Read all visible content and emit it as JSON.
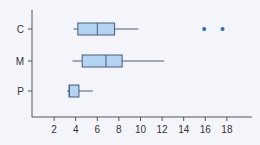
{
  "chart_data": {
    "type": "boxplot",
    "title": "",
    "xlabel": "",
    "ylabel": "",
    "categories": [
      "C",
      "M",
      "P"
    ],
    "x_ticks": [
      2,
      4,
      6,
      8,
      10,
      12,
      14,
      16,
      18
    ],
    "xlim": [
      0,
      20
    ],
    "grid": false,
    "series": [
      {
        "name": "C",
        "whisker_low": 3.8,
        "q1": 4.2,
        "median": 6.0,
        "q3": 7.6,
        "whisker_high": 9.8,
        "outliers": [
          15.9,
          17.6
        ]
      },
      {
        "name": "M",
        "whisker_low": 3.7,
        "q1": 4.6,
        "median": 6.8,
        "q3": 8.3,
        "whisker_high": 12.2,
        "outliers": []
      },
      {
        "name": "P",
        "whisker_low": 3.2,
        "q1": 3.4,
        "median": 3.4,
        "q3": 4.3,
        "whisker_high": 5.6,
        "outliers": []
      }
    ],
    "colors": {
      "box_fill": "#b3d4f5",
      "box_stroke": "#4a5a75",
      "outlier": "#2e6bbd",
      "axis": "#555555"
    }
  }
}
